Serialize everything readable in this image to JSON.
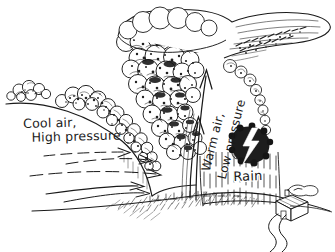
{
  "diagram": {
    "ink_color": "#1a1a1a",
    "background_color": "#ffffff",
    "labels": {
      "cool_air_line1": "Cool air,",
      "cool_air_line2": "High pressure",
      "warm_air": "Warm air,",
      "low_pressure": "Low pressure",
      "rain": "Rain"
    },
    "elements": {
      "cumulonimbus": "cumulonimbus-cloud",
      "anvil": "anvil-cloud-top",
      "left_clouds": "fair-weather-clouds",
      "front_boundary": "cold-front-boundary",
      "cool_air_arrows": "cool-air-flow-arrows",
      "updraft_arrows": "warm-air-updraft-arrows",
      "rain_shaft": "rain-shaft",
      "lightning": "lightning-bolt",
      "house": "house",
      "chimney_smoke": "chimney-smoke",
      "road": "winding-road",
      "ground": "ground-line"
    },
    "counts": {
      "cool_air_arrows": 4,
      "updraft_arrows": 2
    }
  }
}
